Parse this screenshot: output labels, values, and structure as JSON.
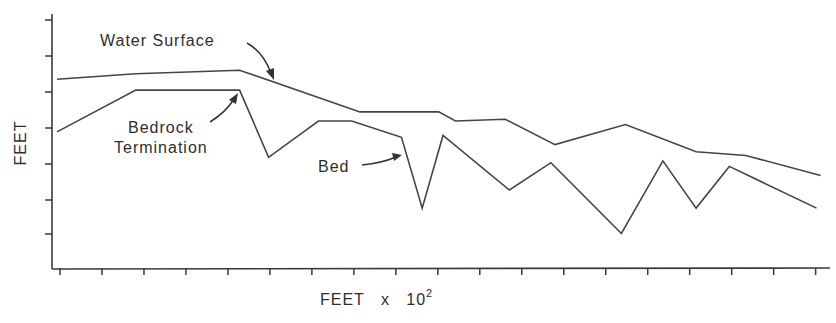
{
  "chart_data": {
    "type": "line",
    "title": "",
    "xlabel": "FEET x 10",
    "xlabel_exponent": "2",
    "ylabel": "FEET",
    "grid": false,
    "legend": "none (inline annotations)",
    "x_ticks_count": 19,
    "y_ticks_count": 7,
    "tick_labels": "none shown",
    "xlim": [
      0,
      18.5
    ],
    "ylim": [
      0,
      7.0
    ],
    "units_note": "x in tick intervals (unlabeled), y in tick intervals above x-axis (unlabeled)",
    "series": [
      {
        "name": "Water Surface",
        "points": [
          [
            0.0,
            5.2
          ],
          [
            1.9,
            5.35
          ],
          [
            4.4,
            5.45
          ],
          [
            7.3,
            4.3
          ],
          [
            9.2,
            4.3
          ],
          [
            9.6,
            4.05
          ],
          [
            10.8,
            4.1
          ],
          [
            12.0,
            3.4
          ],
          [
            13.7,
            3.95
          ],
          [
            15.4,
            3.2
          ],
          [
            16.6,
            3.1
          ],
          [
            18.4,
            2.55
          ]
        ]
      },
      {
        "name": "Bed",
        "points": [
          [
            0.0,
            3.75
          ],
          [
            1.9,
            4.9
          ],
          [
            4.4,
            4.9
          ],
          [
            5.1,
            3.05
          ],
          [
            6.3,
            4.05
          ],
          [
            7.1,
            4.05
          ],
          [
            8.3,
            3.6
          ],
          [
            8.8,
            1.65
          ],
          [
            9.3,
            3.65
          ],
          [
            10.9,
            2.15
          ],
          [
            11.9,
            2.9
          ],
          [
            13.6,
            0.95
          ],
          [
            14.6,
            2.95
          ],
          [
            15.4,
            1.65
          ],
          [
            16.2,
            2.8
          ],
          [
            18.3,
            1.65
          ]
        ]
      }
    ],
    "annotations": [
      {
        "text": "Water Surface",
        "points_to": "Water Surface"
      },
      {
        "text": "Bedrock Termination",
        "lines": [
          "Bedrock",
          "Termination"
        ],
        "points_to": "Bed (end of flat bedrock segment)"
      },
      {
        "text": "Bed",
        "points_to": "Bed"
      }
    ]
  },
  "labels": {
    "y_axis": "FEET",
    "x_axis": "FEET   x   10",
    "x_axis_exp": "2",
    "water_surface": "Water Surface",
    "bedrock_line1": "Bedrock",
    "bedrock_line2": "Termination",
    "bed": "Bed"
  },
  "colors": {
    "line": "#454545",
    "axis": "#3a3a3a",
    "background": "#ffffff"
  }
}
